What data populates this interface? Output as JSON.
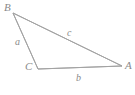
{
  "figure": {
    "type": "geometry-diagram",
    "shape": "triangle",
    "background_color": "#ffffff",
    "stroke_color": "#a3a3a3",
    "text_color": "#8a8a8a",
    "stroke_width": 1,
    "canvas": {
      "width": 135,
      "height": 95
    }
  },
  "vertices": [
    {
      "id": "B",
      "label": "B",
      "x": 13,
      "y": 13
    },
    {
      "id": "C",
      "label": "C",
      "x": 38,
      "y": 69
    },
    {
      "id": "A",
      "label": "A",
      "x": 122,
      "y": 66
    }
  ],
  "sides": [
    {
      "id": "a",
      "label": "a",
      "from": "B",
      "to": "C",
      "opposite_vertex": "A"
    },
    {
      "id": "b",
      "label": "b",
      "from": "C",
      "to": "A",
      "opposite_vertex": "B"
    },
    {
      "id": "c",
      "label": "c",
      "from": "B",
      "to": "A",
      "opposite_vertex": "C"
    }
  ],
  "paths": {
    "triangle": "M 13 13 L 38 69 L 122 66 Z"
  }
}
